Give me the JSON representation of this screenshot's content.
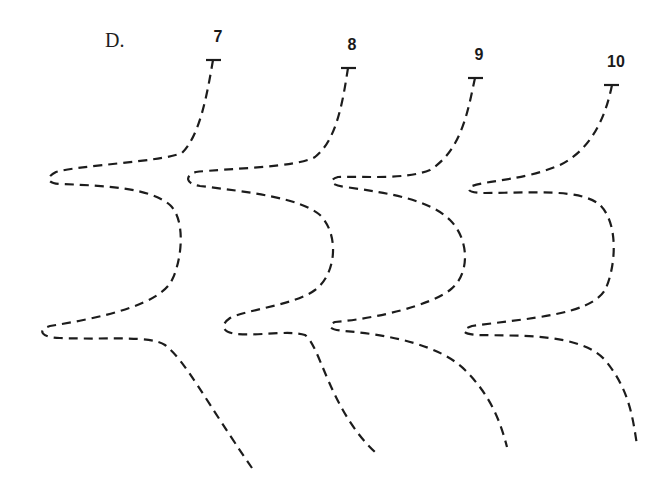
{
  "figure": {
    "panel_label": "D.",
    "line_color": "#1c1c1c",
    "background": "#ffffff",
    "curves": [
      {
        "number": "7",
        "label_pos": [
          217,
          42
        ],
        "t_marker": [
          213,
          60
        ],
        "path": "M213,60 C207,95 200,135 182,153 C160,162 80,165 56,172 C44,178 48,184 62,184 C110,186 150,188 170,205 C186,220 182,260 172,280 C160,305 100,318 50,326 C36,330 42,338 60,338 C110,340 150,335 165,345 C185,360 205,400 252,468"
      },
      {
        "number": "8",
        "label_pos": [
          352,
          50
        ],
        "t_marker": [
          348,
          68
        ],
        "path": "M348,68 C343,100 337,140 315,157 C295,168 230,168 196,172 C184,176 186,184 200,186 C250,192 300,198 320,215 C340,235 336,275 315,290 C295,305 245,310 230,318 C220,325 222,332 236,334 C260,336 290,330 305,335 C320,345 330,410 375,452"
      },
      {
        "number": "9",
        "label_pos": [
          478,
          59
        ],
        "t_marker": [
          475,
          78
        ],
        "path": "M475,78 C468,110 462,150 430,170 C405,180 365,176 338,177 C328,180 330,185 345,187 C390,193 430,200 450,220 C470,240 470,275 450,290 C430,305 380,318 335,322 C326,326 330,330 345,331 C390,335 440,345 465,370 C490,395 500,420 507,447"
      },
      {
        "number": "10",
        "label_pos": [
          616,
          64
        ],
        "t_marker": [
          612,
          85
        ],
        "path": "M612,85 C605,120 590,150 560,165 C525,180 490,180 472,186 C465,190 470,193 485,193 C530,193 580,188 600,205 C620,225 615,270 605,290 C590,315 530,318 472,326 C460,330 462,334 478,335 C520,336 580,333 605,360 C630,390 633,420 637,445"
      }
    ]
  }
}
